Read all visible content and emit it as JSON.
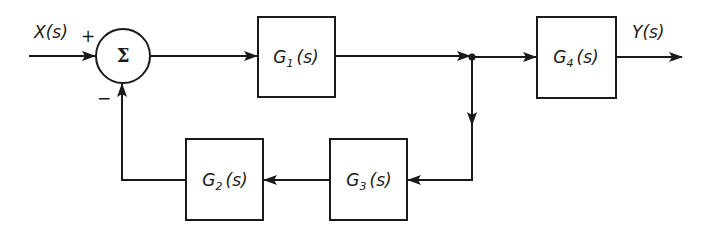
{
  "diagram": {
    "type": "block-diagram",
    "colors": {
      "line": "#1a1a1a",
      "background": "#ffffff"
    },
    "input": {
      "label": "X(s)"
    },
    "output": {
      "label": "Y(s)"
    },
    "summer": {
      "symbol": "Σ",
      "plus_sign": "+",
      "minus_sign": "−"
    },
    "blocks": [
      {
        "id": "G1",
        "name": "G",
        "sub": "1",
        "arg": "(s)"
      },
      {
        "id": "G2",
        "name": "G",
        "sub": "2",
        "arg": "(s)"
      },
      {
        "id": "G3",
        "name": "G",
        "sub": "3",
        "arg": "(s)"
      },
      {
        "id": "G4",
        "name": "G",
        "sub": "4",
        "arg": "(s)"
      }
    ],
    "connections": [
      {
        "from": "X(s)",
        "to": "summer",
        "sign": "+"
      },
      {
        "from": "summer",
        "to": "G1"
      },
      {
        "from": "G1",
        "to": "junction"
      },
      {
        "from": "junction",
        "to": "G4"
      },
      {
        "from": "G4",
        "to": "Y(s)"
      },
      {
        "from": "junction",
        "to": "G3"
      },
      {
        "from": "G3",
        "to": "G2"
      },
      {
        "from": "G2",
        "to": "summer",
        "sign": "−"
      }
    ]
  }
}
